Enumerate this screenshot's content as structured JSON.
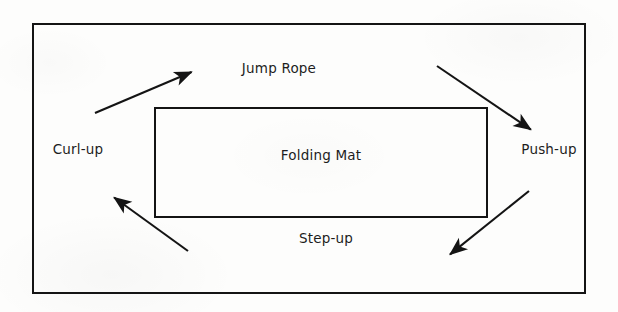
{
  "diagram": {
    "type": "cycle-diagram",
    "line_color": "#141414",
    "text_color": "#1d1d1d",
    "background_color": "#fdfdfc",
    "outer_frame": {
      "name": "room-boundary",
      "label": ""
    },
    "center_node": {
      "label": "Folding Mat",
      "shape": "rectangle"
    },
    "stations": [
      {
        "id": "jump-rope",
        "label": "Jump Rope",
        "position": "top"
      },
      {
        "id": "push-up",
        "label": "Push-up",
        "position": "right"
      },
      {
        "id": "step-up",
        "label": "Step-up",
        "position": "bottom"
      },
      {
        "id": "curl-up",
        "label": "Curl-up",
        "position": "left"
      }
    ],
    "arrows": [
      {
        "id": "arrow-curl-up-to-jump-rope",
        "from": "curl-up",
        "to": "jump-rope",
        "direction": "up-right",
        "x1": 95,
        "y1": 113,
        "x2": 194,
        "y2": 71
      },
      {
        "id": "arrow-jump-rope-to-push-up",
        "from": "jump-rope",
        "to": "push-up",
        "direction": "down-right",
        "x1": 437,
        "y1": 66,
        "x2": 533,
        "y2": 131
      },
      {
        "id": "arrow-push-up-to-step-up",
        "from": "push-up",
        "to": "step-up",
        "direction": "down-left",
        "x1": 529,
        "y1": 191,
        "x2": 448,
        "y2": 256
      },
      {
        "id": "arrow-step-up-to-curl-up",
        "from": "step-up",
        "to": "curl-up",
        "direction": "up-left",
        "x1": 188,
        "y1": 251,
        "x2": 112,
        "y2": 196
      }
    ]
  }
}
